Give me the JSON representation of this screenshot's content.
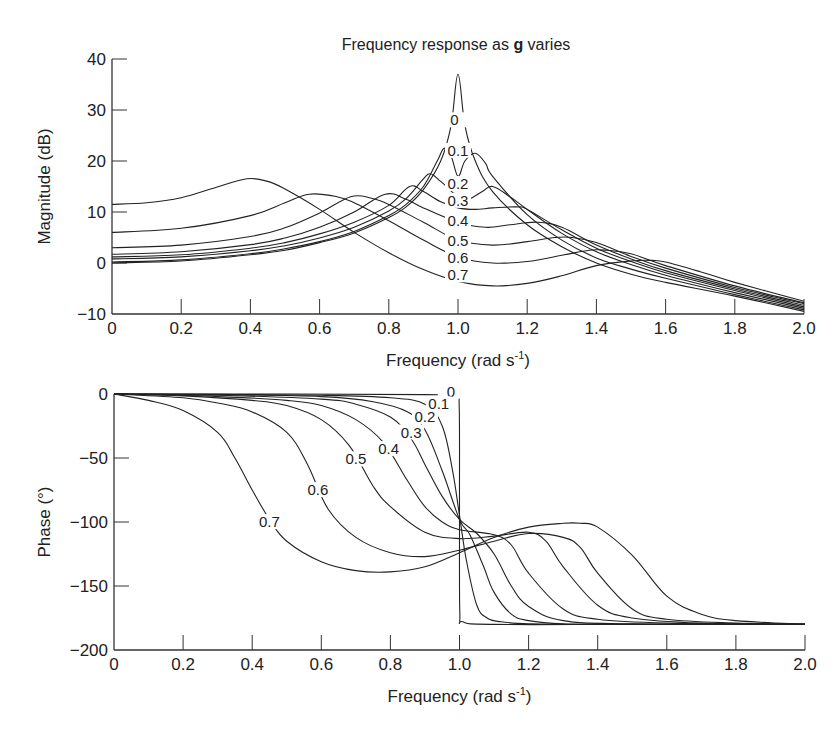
{
  "chart_data": [
    {
      "type": "line",
      "title_prefix": "Frequency response as ",
      "title_bold": "g",
      "title_suffix": " varies",
      "xlabel": "Frequency (rad s",
      "xlabel_sup": "-1",
      "xlabel_close": ")",
      "ylabel": "Magnitude (dB)",
      "xlim": [
        0,
        2.0
      ],
      "ylim": [
        -10,
        40
      ],
      "xticks": [
        0,
        0.2,
        0.4,
        0.6,
        0.8,
        1.0,
        1.2,
        1.4,
        1.6,
        1.8,
        2.0
      ],
      "xtick_labels": [
        "0",
        "0.2",
        "0.4",
        "0.6",
        "0.8",
        "1.0",
        "1.2",
        "1.4",
        "1.6",
        "1.8",
        "2.0"
      ],
      "yticks": [
        -10,
        0,
        10,
        20,
        30,
        40
      ],
      "ytick_labels": [
        "−10",
        "0",
        "10",
        "20",
        "30",
        "40"
      ],
      "grid": false,
      "legend": "inline labels",
      "series": [
        {
          "name": "0",
          "label_pos": [
            0.99,
            27
          ],
          "x": [
            0,
            0.2,
            0.4,
            0.5,
            0.6,
            0.7,
            0.8,
            0.85,
            0.9,
            0.95,
            0.98,
            1.0,
            1.02,
            1.05,
            1.1,
            1.2,
            1.3,
            1.4,
            1.5,
            1.6,
            1.8,
            2.0
          ],
          "y": [
            0,
            0.4,
            1.6,
            2.5,
            4.0,
            5.9,
            8.9,
            11.0,
            14.4,
            20.0,
            27.0,
            37.0,
            27.0,
            20.0,
            14.0,
            7.5,
            3.2,
            0.0,
            -2.2,
            -3.8,
            -6.5,
            -9.5
          ]
        },
        {
          "name": "0.1",
          "label_pos": [
            1.0,
            21
          ],
          "x": [
            0,
            0.2,
            0.4,
            0.5,
            0.6,
            0.7,
            0.8,
            0.85,
            0.9,
            0.94,
            0.96,
            0.98,
            1.0,
            1.02,
            1.05,
            1.08,
            1.1,
            1.2,
            1.3,
            1.4,
            1.5,
            1.6,
            1.8,
            2.0
          ],
          "y": [
            0.2,
            0.6,
            1.8,
            2.8,
            4.2,
            6.2,
            9.3,
            11.5,
            15.0,
            20.0,
            22.5,
            21.0,
            17.0,
            20.0,
            21.5,
            19.5,
            17.0,
            9.5,
            4.5,
            1.0,
            -1.2,
            -3.0,
            -6.2,
            -9.2
          ]
        },
        {
          "name": "0.2",
          "label_pos": [
            1.0,
            14.5
          ],
          "x": [
            0,
            0.2,
            0.4,
            0.5,
            0.6,
            0.7,
            0.8,
            0.85,
            0.9,
            0.92,
            0.95,
            1.0,
            1.03,
            1.07,
            1.1,
            1.15,
            1.2,
            1.3,
            1.4,
            1.5,
            1.6,
            1.8,
            2.0
          ],
          "y": [
            0.8,
            1.2,
            2.4,
            3.4,
            4.9,
            7.0,
            10.2,
            12.6,
            16.5,
            17.5,
            16.0,
            13.0,
            12.5,
            14.0,
            15.0,
            13.0,
            10.5,
            5.8,
            2.2,
            -0.3,
            -2.4,
            -5.8,
            -8.9
          ]
        },
        {
          "name": "0.3",
          "label_pos": [
            1.0,
            11.2
          ],
          "x": [
            0,
            0.2,
            0.4,
            0.5,
            0.6,
            0.7,
            0.8,
            0.86,
            0.9,
            0.95,
            1.0,
            1.05,
            1.1,
            1.17,
            1.2,
            1.3,
            1.4,
            1.5,
            1.6,
            1.8,
            2.0
          ],
          "y": [
            1.2,
            1.6,
            2.9,
            4.0,
            5.7,
            8.0,
            11.3,
            15.0,
            14.0,
            12.0,
            10.8,
            10.5,
            10.8,
            11.0,
            10.5,
            6.5,
            2.9,
            0.3,
            -1.9,
            -5.4,
            -8.6
          ]
        },
        {
          "name": "0.4",
          "label_pos": [
            1.0,
            7.3
          ],
          "x": [
            0,
            0.2,
            0.4,
            0.5,
            0.6,
            0.7,
            0.79,
            0.85,
            0.9,
            1.0,
            1.08,
            1.15,
            1.23,
            1.3,
            1.4,
            1.5,
            1.6,
            1.8,
            2.0
          ],
          "y": [
            1.7,
            2.2,
            3.6,
            4.9,
            7.0,
            10.0,
            13.5,
            12.5,
            10.8,
            8.0,
            7.0,
            7.5,
            8.0,
            7.0,
            3.5,
            0.8,
            -1.5,
            -5.1,
            -8.3
          ]
        },
        {
          "name": "0.5",
          "label_pos": [
            1.0,
            3.3
          ],
          "x": [
            0,
            0.2,
            0.4,
            0.5,
            0.6,
            0.69,
            0.75,
            0.8,
            0.9,
            1.0,
            1.1,
            1.2,
            1.28,
            1.33,
            1.4,
            1.5,
            1.6,
            1.8,
            2.0
          ],
          "y": [
            3.0,
            3.5,
            5.2,
            6.9,
            9.8,
            13.0,
            12.7,
            11.5,
            8.0,
            4.5,
            3.5,
            4.2,
            5.0,
            5.0,
            4.0,
            1.3,
            -1.0,
            -4.8,
            -8.0
          ]
        },
        {
          "name": "0.6",
          "label_pos": [
            1.0,
            0.0
          ],
          "x": [
            0,
            0.2,
            0.4,
            0.5,
            0.57,
            0.65,
            0.7,
            0.8,
            0.9,
            1.0,
            1.1,
            1.2,
            1.3,
            1.38,
            1.43,
            1.5,
            1.6,
            1.8,
            2.0
          ],
          "y": [
            6.0,
            6.8,
            9.3,
            11.8,
            13.5,
            13.0,
            11.8,
            8.3,
            4.5,
            1.2,
            0.0,
            0.3,
            1.5,
            2.5,
            2.5,
            1.8,
            -0.5,
            -4.5,
            -7.8
          ]
        },
        {
          "name": "0.7",
          "label_pos": [
            1.0,
            -3.4
          ],
          "x": [
            0,
            0.1,
            0.2,
            0.3,
            0.39,
            0.45,
            0.5,
            0.6,
            0.7,
            0.8,
            0.9,
            1.0,
            1.1,
            1.2,
            1.3,
            1.4,
            1.5,
            1.56,
            1.6,
            1.7,
            1.8,
            2.0
          ],
          "y": [
            11.5,
            11.8,
            12.8,
            14.8,
            16.5,
            16.0,
            14.5,
            10.5,
            6.0,
            2.0,
            -1.3,
            -3.6,
            -4.5,
            -4.0,
            -2.5,
            -0.5,
            0.4,
            0.5,
            0.2,
            -1.7,
            -3.8,
            -7.5
          ]
        }
      ]
    },
    {
      "type": "line",
      "xlabel": "Frequency (rad s",
      "xlabel_sup": "-1",
      "xlabel_close": ")",
      "ylabel": "Phase (°)",
      "xlim": [
        0,
        2.0
      ],
      "ylim": [
        -200,
        0
      ],
      "xticks": [
        0,
        0.2,
        0.4,
        0.6,
        0.8,
        1.0,
        1.2,
        1.4,
        1.6,
        1.8,
        2.0
      ],
      "xtick_labels": [
        "0",
        "0.2",
        "0.4",
        "0.6",
        "0.8",
        "1.0",
        "1.2",
        "1.4",
        "1.6",
        "1.8",
        "2.0"
      ],
      "yticks": [
        -200,
        -150,
        -100,
        -50,
        0
      ],
      "ytick_labels": [
        "−200",
        "−150",
        "−100",
        "−50",
        "0"
      ],
      "grid": false,
      "legend": "inline labels",
      "series": [
        {
          "name": "0",
          "label_pos": [
            0.975,
            -2
          ],
          "x": [
            0,
            0.5,
            0.9,
            0.99,
            0.999,
            1.0,
            1.001,
            1.01,
            1.1,
            1.5,
            2.0
          ],
          "y": [
            0,
            0,
            -0.5,
            -2,
            -10,
            -90,
            -170,
            -178,
            -180,
            -180,
            -180
          ]
        },
        {
          "name": "0.1",
          "label_pos": [
            0.94,
            -12
          ],
          "x": [
            0,
            0.3,
            0.6,
            0.8,
            0.9,
            0.95,
            0.98,
            1.0,
            1.02,
            1.05,
            1.08,
            1.12,
            1.2,
            1.4,
            2.0
          ],
          "y": [
            0,
            -0.3,
            -1,
            -3,
            -8,
            -25,
            -60,
            -95,
            -130,
            -165,
            -175,
            -178,
            -179.5,
            -180,
            -180
          ]
        },
        {
          "name": "0.2",
          "label_pos": [
            0.9,
            -22
          ],
          "x": [
            0,
            0.3,
            0.6,
            0.75,
            0.85,
            0.9,
            0.95,
            1.0,
            1.03,
            1.07,
            1.1,
            1.15,
            1.2,
            1.3,
            1.5,
            2.0
          ],
          "y": [
            0,
            -0.5,
            -2,
            -6,
            -14,
            -28,
            -60,
            -98,
            -110,
            -135,
            -155,
            -172,
            -177,
            -179.5,
            -180,
            -180
          ]
        },
        {
          "name": "0.3",
          "label_pos": [
            0.86,
            -34
          ],
          "x": [
            0,
            0.3,
            0.6,
            0.7,
            0.8,
            0.86,
            0.9,
            0.95,
            1.0,
            1.05,
            1.1,
            1.15,
            1.2,
            1.3,
            1.5,
            2.0
          ],
          "y": [
            0,
            -1,
            -4,
            -8,
            -18,
            -35,
            -55,
            -80,
            -98,
            -109,
            -125,
            -150,
            -166,
            -177,
            -179.5,
            -180
          ]
        },
        {
          "name": "0.4",
          "label_pos": [
            0.795,
            -47
          ],
          "x": [
            0,
            0.3,
            0.5,
            0.6,
            0.7,
            0.78,
            0.85,
            0.9,
            0.95,
            1.0,
            1.1,
            1.15,
            1.2,
            1.3,
            1.4,
            1.6,
            2.0
          ],
          "y": [
            0,
            -2,
            -5,
            -9,
            -20,
            -38,
            -68,
            -88,
            -100,
            -106,
            -110,
            -118,
            -140,
            -168,
            -176,
            -179,
            -180
          ]
        },
        {
          "name": "0.5",
          "label_pos": [
            0.7,
            -55
          ],
          "x": [
            0,
            0.2,
            0.4,
            0.5,
            0.6,
            0.68,
            0.75,
            0.8,
            0.9,
            1.0,
            1.1,
            1.2,
            1.25,
            1.3,
            1.4,
            1.5,
            1.7,
            2.0
          ],
          "y": [
            0,
            -1.5,
            -5,
            -9,
            -20,
            -40,
            -72,
            -88,
            -108,
            -113,
            -111,
            -108,
            -115,
            -135,
            -165,
            -175,
            -179,
            -180
          ]
        },
        {
          "name": "0.6",
          "label_pos": [
            0.59,
            -79
          ],
          "x": [
            0,
            0.2,
            0.3,
            0.4,
            0.5,
            0.56,
            0.62,
            0.7,
            0.8,
            0.9,
            1.0,
            1.1,
            1.2,
            1.3,
            1.35,
            1.4,
            1.5,
            1.6,
            1.8,
            2.0
          ],
          "y": [
            0,
            -3,
            -7,
            -14,
            -30,
            -55,
            -90,
            -112,
            -124,
            -127,
            -122,
            -115,
            -109,
            -112,
            -120,
            -140,
            -168,
            -176,
            -179,
            -180
          ]
        },
        {
          "name": "0.7",
          "label_pos": [
            0.45,
            -104
          ],
          "x": [
            0,
            0.1,
            0.2,
            0.3,
            0.35,
            0.4,
            0.45,
            0.5,
            0.6,
            0.7,
            0.8,
            0.9,
            1.0,
            1.1,
            1.2,
            1.3,
            1.35,
            1.4,
            1.5,
            1.6,
            1.7,
            1.8,
            2.0
          ],
          "y": [
            0,
            -5,
            -13,
            -30,
            -50,
            -75,
            -98,
            -115,
            -131,
            -138,
            -139,
            -135,
            -124,
            -112,
            -104,
            -101,
            -101,
            -104,
            -126,
            -158,
            -172,
            -177,
            -180
          ]
        }
      ]
    }
  ],
  "figure": {
    "magnitude_panel": {
      "name": "magnitude-chart"
    },
    "phase_panel": {
      "name": "phase-chart"
    }
  }
}
